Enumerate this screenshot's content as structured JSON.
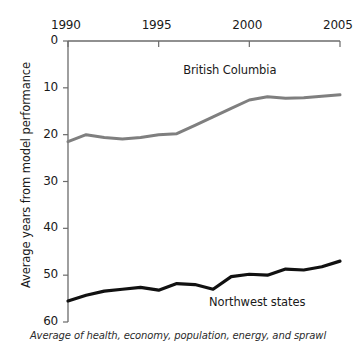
{
  "chart_data": {
    "type": "line",
    "title": "",
    "subtitle": "",
    "caption": "Average of health, economy, population, energy, and sprawl",
    "xlabel": "",
    "ylabel": "Average years from model performance",
    "xlim": [
      1990,
      2005
    ],
    "ylim": [
      0,
      60
    ],
    "y_axis_inverted": true,
    "x_ticks": [
      1990,
      1995,
      2000,
      2005
    ],
    "x_tick_labels": [
      "1990",
      "1995",
      "2000",
      "2005"
    ],
    "y_ticks": [
      0,
      10,
      20,
      30,
      40,
      50,
      60
    ],
    "y_tick_labels": [
      "0",
      "10",
      "20",
      "30",
      "40",
      "50",
      "60"
    ],
    "grid": false,
    "legend_position": "inline-annotation",
    "x": [
      1990,
      1991,
      1992,
      1993,
      1994,
      1995,
      1996,
      1997,
      1998,
      1999,
      2000,
      2001,
      2002,
      2003,
      2004,
      2005
    ],
    "series": [
      {
        "name": "British Columbia",
        "color": "#7f7f7f",
        "line_width": 3.0,
        "values": [
          21.5,
          20.0,
          20.6,
          20.9,
          20.6,
          20.0,
          19.8,
          18.0,
          16.2,
          14.4,
          12.6,
          11.9,
          12.2,
          12.1,
          11.8,
          11.5
        ],
        "label_x": 1999.0,
        "label_y": 6.5
      },
      {
        "name": "Northwest states",
        "color": "#111111",
        "line_width": 3.2,
        "values": [
          55.5,
          54.3,
          53.4,
          53.0,
          52.6,
          53.2,
          51.8,
          52.0,
          53.0,
          50.3,
          49.8,
          50.0,
          48.7,
          48.9,
          48.2,
          47.0
        ],
        "label_x": 2000.2,
        "label_y": 56.0
      }
    ],
    "axis_color": "#6b6b6b"
  },
  "axes": {
    "x_tick_labels": [
      "1990",
      "1995",
      "2000",
      "2005"
    ],
    "y_tick_labels": [
      "0",
      "10",
      "20",
      "30",
      "40",
      "50",
      "60"
    ],
    "y_axis_title": "Average years from model performance"
  },
  "annotations": {
    "series_one_label": "British Columbia",
    "series_two_label": "Northwest states",
    "footnote": "Average of health, economy, population, energy, and sprawl"
  }
}
